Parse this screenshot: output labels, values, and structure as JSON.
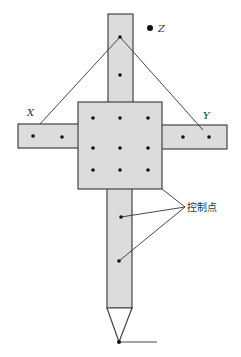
{
  "diagram": {
    "type": "cross-shaped target with control points",
    "labels": {
      "x_axis": "X",
      "y_axis": "Y",
      "z_axis": "Z",
      "control_points": "控制点"
    },
    "colors": {
      "fill": "#dcdcdc",
      "stroke": "#444444",
      "point": "#111111"
    },
    "point_counts": {
      "top_stem": 2,
      "center_square": 9,
      "left_arm": 2,
      "right_arm": 2,
      "lower_stem": 2
    }
  }
}
